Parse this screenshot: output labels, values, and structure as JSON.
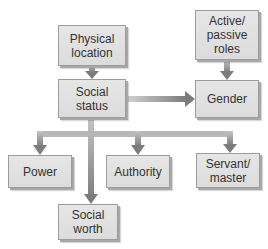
{
  "diagram": {
    "nodes": {
      "physical_location": {
        "label": "Physical location"
      },
      "active_passive_roles": {
        "label": "Active/ passive roles"
      },
      "social_status": {
        "label": "Social status"
      },
      "gender": {
        "label": "Gender"
      },
      "power": {
        "label": "Power"
      },
      "authority": {
        "label": "Authority"
      },
      "servant_master": {
        "label": "Servant/ master"
      },
      "social_worth": {
        "label": "Social worth"
      }
    },
    "edges": [
      {
        "from": "Physical location",
        "to": "Social status"
      },
      {
        "from": "Active/ passive roles",
        "to": "Gender"
      },
      {
        "from": "Social status",
        "to": "Gender"
      },
      {
        "from": "Social status",
        "to": "Power"
      },
      {
        "from": "Social status",
        "to": "Authority"
      },
      {
        "from": "Social status",
        "to": "Servant/ master"
      },
      {
        "from": "Social status",
        "to": "Social worth"
      }
    ],
    "colors": {
      "box_fill": "#e0e0e0",
      "box_border": "#9c9c9c",
      "arrow": "#8a8a8a",
      "arrow_light": "#c8c8c8",
      "text": "#333333"
    }
  }
}
